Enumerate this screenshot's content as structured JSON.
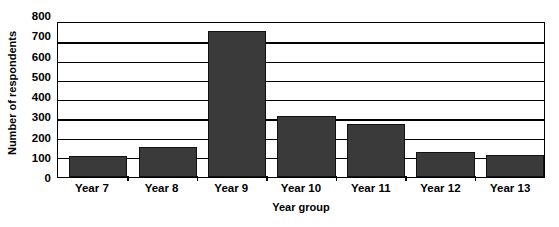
{
  "chart_data": {
    "type": "bar",
    "title": "",
    "xlabel": "Year group",
    "ylabel": "Number of respondents",
    "categories": [
      "Year 7",
      "Year 8",
      "Year 9",
      "Year 10",
      "Year 11",
      "Year 12",
      "Year 13"
    ],
    "values": [
      110,
      155,
      760,
      315,
      275,
      130,
      115
    ],
    "ylim": [
      0,
      800
    ],
    "yticks": [
      0,
      100,
      200,
      300,
      400,
      500,
      600,
      700,
      800
    ],
    "ytick_labels": [
      "0",
      "100",
      "200",
      "300",
      "400",
      "500",
      "600",
      "700",
      "800"
    ],
    "grid": true,
    "legend": "none",
    "bar_color": "#3a3a3a",
    "bar_border_color": "#111111",
    "axis_color": "#000000",
    "background_color": "#ffffff"
  }
}
